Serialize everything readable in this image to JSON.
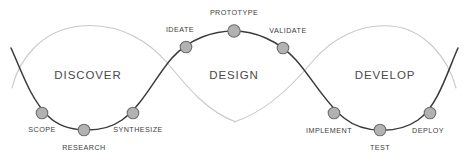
{
  "diagram": {
    "colors": {
      "dark_curve": "#3a3a3a",
      "light_curve": "#c9c9c9",
      "node_fill": "#b2b2b2",
      "node_stroke": "#6e6e6e",
      "phase_text": "#4a4a4a",
      "node_text": "#3d3d3d",
      "background": "#ffffff"
    },
    "phases": [
      {
        "label": "DISCOVER",
        "x": 88,
        "y": 76
      },
      {
        "label": "DESIGN",
        "x": 234,
        "y": 76
      },
      {
        "label": "DEVELOP",
        "x": 385,
        "y": 76
      }
    ],
    "nodes": [
      {
        "label": "SCOPE",
        "cx": 42,
        "cy": 113,
        "r": 5.8,
        "label_x": 42,
        "label_y": 130
      },
      {
        "label": "RESEARCH",
        "cx": 84,
        "cy": 130,
        "r": 5.8,
        "label_x": 84,
        "label_y": 148
      },
      {
        "label": "SYNTHESIZE",
        "cx": 133,
        "cy": 113,
        "r": 5.8,
        "label_x": 138,
        "label_y": 130
      },
      {
        "label": "IDEATE",
        "cx": 186,
        "cy": 47,
        "r": 5.8,
        "label_x": 180,
        "label_y": 30
      },
      {
        "label": "PROTOTYPE",
        "cx": 234,
        "cy": 31,
        "r": 6.2,
        "label_x": 234,
        "label_y": 13
      },
      {
        "label": "VALIDATE",
        "cx": 283,
        "cy": 48,
        "r": 5.8,
        "label_x": 288,
        "label_y": 31
      },
      {
        "label": "IMPLEMENT",
        "cx": 334,
        "cy": 113,
        "r": 5.8,
        "label_x": 329,
        "label_y": 131
      },
      {
        "label": "TEST",
        "cx": 380,
        "cy": 130,
        "r": 5.8,
        "label_x": 380,
        "label_y": 148
      },
      {
        "label": "DEPLOY",
        "cx": 430,
        "cy": 113,
        "r": 5.8,
        "label_x": 428,
        "label_y": 131
      }
    ],
    "paths": {
      "dark_curve": "M 11 48 C 22 72, 30 98, 48 116 C 66 134, 102 134, 122 120 C 142 106, 156 76, 172 58 C 190 38, 214 31, 234 31 C 254 31, 278 40, 296 60 C 312 78, 326 104, 344 118 C 364 134, 398 134, 418 120 C 438 106, 448 70, 458 48",
      "light_curve_left": "M 12 88 C 18 62, 40 30, 80 26 C 122 22, 152 44, 170 66 C 188 88, 208 112, 236 122",
      "light_curve_right": "M 234 122 C 266 112, 292 86, 312 62 C 332 38, 360 24, 390 26 C 424 28, 448 58, 456 88"
    }
  }
}
